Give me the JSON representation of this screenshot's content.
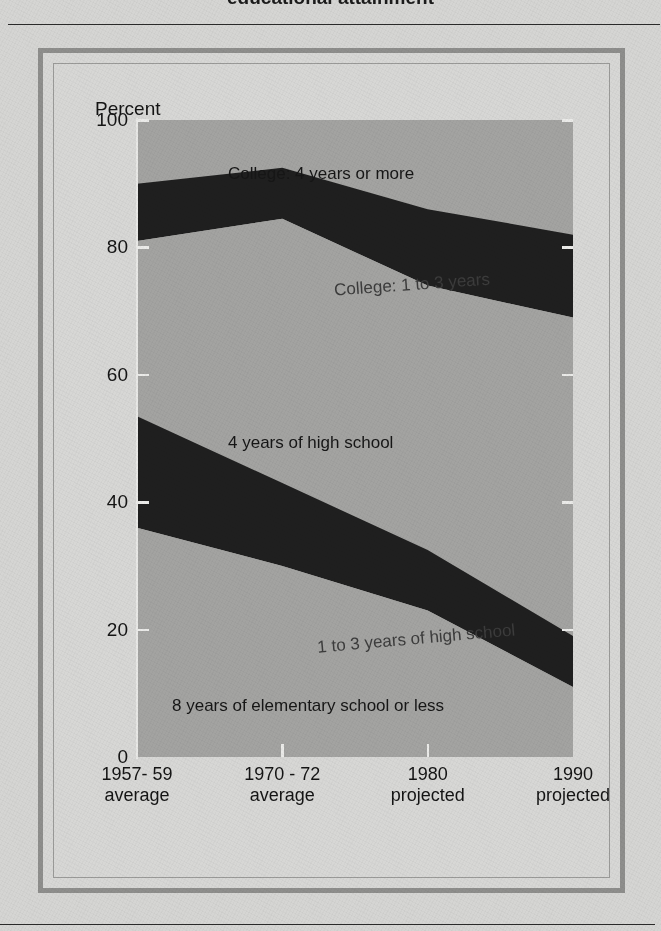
{
  "page": {
    "cut_off_heading": "educational attainment",
    "background_color": "#d5d5d3",
    "frame_color": "#8e8e8c"
  },
  "chart_data": {
    "type": "area",
    "title": "",
    "xlabel": "",
    "ylabel": "Percent",
    "ylim": [
      0,
      100
    ],
    "yticks": [
      0,
      20,
      40,
      60,
      80,
      100
    ],
    "ytick_labels": [
      "0",
      "20",
      "40",
      "60",
      "80",
      "100"
    ],
    "grid": false,
    "legend_position": "inline-band-labels",
    "x": [
      "1957- 59 average",
      "1970 - 72 average",
      "1980 projected",
      "1990 projected"
    ],
    "x_tick_labels": [
      {
        "line1": "1957- 59",
        "line2": "average"
      },
      {
        "line1": "1970 - 72",
        "line2": "average"
      },
      {
        "line1": "1980",
        "line2": "projected"
      },
      {
        "line1": "1990",
        "line2": "projected"
      }
    ],
    "stacking": "cumulative-from-top",
    "note": "Bands are cumulative shares read from the top of the plot downward; each series value is the percent of the group at or above that education level.",
    "series": [
      {
        "name": "College: 4 years or more",
        "label": "College:  4 years or more",
        "shade": "light",
        "boundary_top_percent": [
          100,
          100,
          100,
          100
        ],
        "boundary_bottom_percent": [
          90,
          92.5,
          86,
          82
        ],
        "values": [
          10,
          7.5,
          14,
          18
        ]
      },
      {
        "name": "College: 1 to 3 years",
        "label": "College:  1 to 3 years",
        "shade": "dark",
        "boundary_top_percent": [
          90,
          92.5,
          86,
          82
        ],
        "boundary_bottom_percent": [
          81,
          84.5,
          74,
          69
        ],
        "values": [
          9,
          8,
          12,
          13
        ]
      },
      {
        "name": "4 years of high school",
        "label": "4 years of high school",
        "shade": "light",
        "boundary_top_percent": [
          81,
          84.5,
          74,
          69
        ],
        "boundary_bottom_percent": [
          53.5,
          43,
          32.5,
          19
        ],
        "values": [
          27.5,
          41.5,
          41.5,
          50
        ]
      },
      {
        "name": "1 to 3 years of high school",
        "label": "1 to 3 years of high school",
        "shade": "dark",
        "boundary_top_percent": [
          53.5,
          43,
          32.5,
          19
        ],
        "boundary_bottom_percent": [
          36,
          30,
          23,
          11
        ],
        "values": [
          17.5,
          13,
          9.5,
          8
        ]
      },
      {
        "name": "8 years of elementary school or less",
        "label": "8  years of elementary school or less",
        "shade": "light",
        "boundary_top_percent": [
          36,
          30,
          23,
          11
        ],
        "boundary_bottom_percent": [
          0,
          0,
          0,
          0
        ],
        "values": [
          36,
          30,
          23,
          11
        ]
      }
    ],
    "colors": {
      "plot_background": "#a3a3a1",
      "dark_band": "#1f1f1f",
      "axis": "#ebebe9",
      "text": "#141414"
    }
  }
}
